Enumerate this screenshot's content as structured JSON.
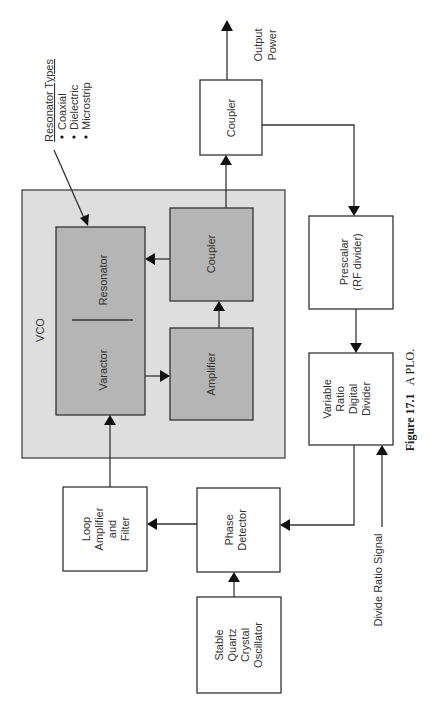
{
  "diagram": {
    "title": "A PLO.",
    "figure_label": "Figure 17.1",
    "orientation": "rotated 90deg counter-clockwise",
    "vco": {
      "label": "VCO",
      "blocks": {
        "resonator": "Resonator",
        "varactor": "Varactor",
        "amplifier": "Amplifier",
        "coupler": "Coupler"
      }
    },
    "resonator_types": {
      "title": "Resonator Types",
      "items": [
        "Coaxial",
        "Dielectric",
        "Microstrip"
      ]
    },
    "blocks": {
      "output_coupler": "Coupler",
      "prescalar_l1": "Prescalar",
      "prescalar_l2": "(RF divider)",
      "divider_l1": "Variable",
      "divider_l2": "Ratio",
      "divider_l3": "Digital",
      "divider_l4": "Divider",
      "phase_l1": "Phase",
      "phase_l2": "Detector",
      "loop_l1": "Loop",
      "loop_l2": "Amplifier",
      "loop_l3": "and",
      "loop_l4": "Filter",
      "osc_l1": "Stable",
      "osc_l2": "Quartz",
      "osc_l3": "Crystal",
      "osc_l4": "Oscillator"
    },
    "signals": {
      "output_l1": "Output",
      "output_l2": "Power",
      "divide_ratio": "Divide Ratio Signal"
    },
    "connections": [
      [
        "Stable Quartz Crystal Oscillator",
        "Phase Detector"
      ],
      [
        "Phase Detector",
        "Loop Amplifier and Filter"
      ],
      [
        "Loop Amplifier and Filter",
        "Varactor"
      ],
      [
        "Varactor",
        "Amplifier"
      ],
      [
        "Amplifier",
        "Coupler (VCO)"
      ],
      [
        "Coupler (VCO)",
        "Resonator"
      ],
      [
        "Coupler (VCO)",
        "Coupler"
      ],
      [
        "Coupler",
        "Output Power"
      ],
      [
        "Coupler",
        "Prescalar (RF divider)"
      ],
      [
        "Prescalar (RF divider)",
        "Variable Ratio Digital Divider"
      ],
      [
        "Divide Ratio Signal",
        "Variable Ratio Digital Divider"
      ],
      [
        "Variable Ratio Digital Divider",
        "Phase Detector"
      ],
      [
        "Resonator Types",
        "Resonator"
      ]
    ]
  }
}
